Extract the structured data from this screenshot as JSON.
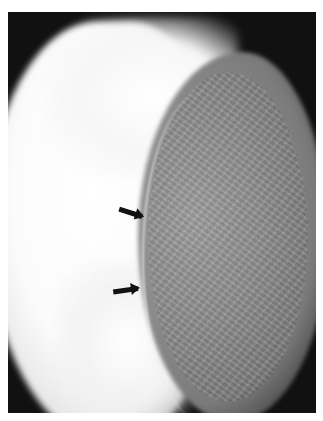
{
  "image": {
    "description": "Grayscale mammographic radiograph showing a bright fatty region on the left and denser fibroglandular tissue on the right, separated by a curved boundary",
    "background_color": "#ffffff",
    "frame_color": "#111111"
  },
  "annotations": [
    {
      "type": "arrow",
      "direction": "right",
      "color": "#111111",
      "points_to": "tissue boundary (upper)"
    },
    {
      "type": "arrow",
      "direction": "right",
      "color": "#111111",
      "points_to": "tissue boundary (lower)"
    }
  ]
}
